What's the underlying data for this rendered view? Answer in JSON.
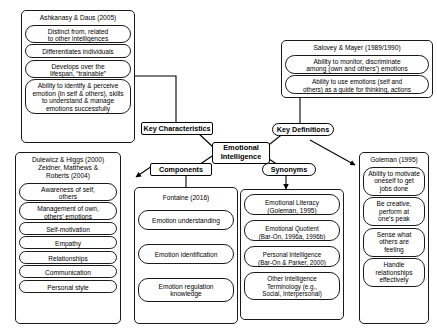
{
  "diagram": {
    "center": {
      "label": "Emotional\nIntelligence"
    },
    "hubs": {
      "key_characteristics": "Key Characteristics",
      "key_definitions": "Key Definitions",
      "components": "Components",
      "synonyms": "Synonyms"
    },
    "clusters": [
      {
        "id": "ashkanasy",
        "title": "Ashkanasy & Daus (2005)",
        "items": [
          "Distinct from, related\nto other intelligences",
          "Differentiates individuals",
          "Develops over the\nlifespan, “trainable”",
          "Ability to identify & perceive\nemotion (in self & others), skills\nto understand & manage\nemotions successfully"
        ]
      },
      {
        "id": "salovey-mayer",
        "title": "Salovey & Mayer (1989/1990)",
        "items": [
          "Ability to monitor, discriminate\namong (own and others’) emotions",
          "Ability to use emotions (self and\nothers) as a guide for thinking, actions"
        ]
      },
      {
        "id": "dulewicz-higgs",
        "title": "Dulewicz & Higgs (2000)\nZeidner, Matthews &\nRoberts (2004)",
        "items": [
          "Awareness of self,\nothers",
          "Management of own,\nothers’ emotions",
          "Self-motivation",
          "Empathy",
          "Relationships",
          "Communication",
          "Personal style"
        ]
      },
      {
        "id": "fontaine",
        "title": "Fontaine (2016)",
        "items": [
          "Emotion understanding",
          "Emotion identification",
          "Emotion regulation\nknowledge"
        ]
      },
      {
        "id": "synonyms-list",
        "title": "",
        "items": [
          "Emotional Literacy\n(Goleman, 1995)",
          "Emotional Quotient\n(Bar-On, 1996a, 1996b)",
          "Personal Intelligence\n(Bar-On & Parker, 2000)",
          "Other Intelligence\nTerminology (e.g.,\nSocial, Interpersonal)"
        ]
      },
      {
        "id": "goleman",
        "title": "Goleman (1995)",
        "items": [
          "Ability to motivate\noneself to get\njobs done",
          "Be creative,\nperform at\none’s peak",
          "Sense what\nothers are\nfeeling",
          "Handle\nrelationships\neffectively"
        ]
      }
    ]
  }
}
